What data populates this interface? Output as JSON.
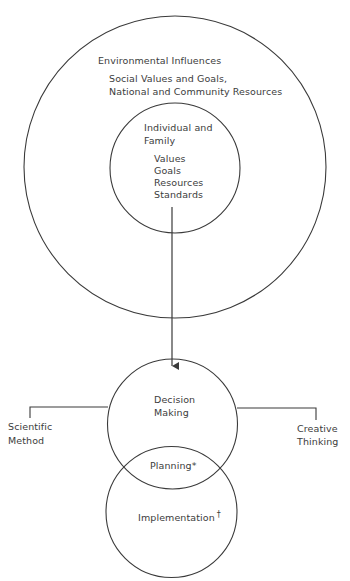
{
  "diagram": {
    "outer_circle": {
      "title": "Environmental Influences",
      "line1": "Social Values and Goals,",
      "line2": "National and Community Resources"
    },
    "inner_circle": {
      "title_line1": "Individual and",
      "title_line2": "Family",
      "items": [
        "Values",
        "Goals",
        "Resources",
        "Standards"
      ]
    },
    "decision_circle": {
      "line1": "Decision",
      "line2": "Making"
    },
    "left_branch": {
      "line1": "Scientific",
      "line2": "Method"
    },
    "right_branch": {
      "line1": "Creative",
      "line2": "Thinking"
    },
    "overlap_label": "Planning*",
    "implementation_circle": {
      "label": "Implementation",
      "footnote_mark": "†"
    },
    "colors": {
      "stroke": "#3a3a3a",
      "text": "#3c3c3c",
      "background": "#ffffff"
    }
  }
}
